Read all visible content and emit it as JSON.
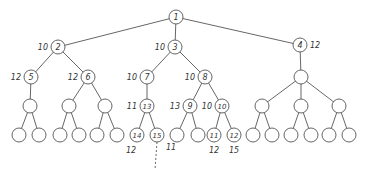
{
  "diagram": {
    "type": "tree",
    "stroke_color": "#555555",
    "node_radius": 7,
    "nodes": [
      {
        "id": "n1",
        "x": 176,
        "y": 17,
        "label": "1",
        "weight": "",
        "weight_side": "left"
      },
      {
        "id": "n2",
        "x": 58,
        "y": 47,
        "label": "2",
        "weight": "10",
        "weight_side": "left"
      },
      {
        "id": "n3",
        "x": 175,
        "y": 47,
        "label": "3",
        "weight": "10",
        "weight_side": "left"
      },
      {
        "id": "n4",
        "x": 300,
        "y": 45,
        "label": "4",
        "weight": "12",
        "weight_side": "right"
      },
      {
        "id": "n5",
        "x": 31,
        "y": 77,
        "label": "5",
        "weight": "12",
        "weight_side": "left"
      },
      {
        "id": "n6",
        "x": 88,
        "y": 77,
        "label": "6",
        "weight": "12",
        "weight_side": "left"
      },
      {
        "id": "n7",
        "x": 147,
        "y": 77,
        "label": "7",
        "weight": "10",
        "weight_side": "left"
      },
      {
        "id": "n8",
        "x": 205,
        "y": 77,
        "label": "8",
        "weight": "10",
        "weight_side": "left"
      },
      {
        "id": "n4a",
        "x": 301,
        "y": 77,
        "label": "",
        "weight": "",
        "weight_side": "left"
      },
      {
        "id": "n5a",
        "x": 30,
        "y": 106,
        "label": "",
        "weight": "",
        "weight_side": "left"
      },
      {
        "id": "n6a",
        "x": 69,
        "y": 106,
        "label": "",
        "weight": "",
        "weight_side": "left"
      },
      {
        "id": "n6b",
        "x": 105,
        "y": 106,
        "label": "",
        "weight": "",
        "weight_side": "left"
      },
      {
        "id": "n13",
        "x": 147,
        "y": 106,
        "label": "13",
        "weight": "11",
        "weight_side": "left"
      },
      {
        "id": "n9",
        "x": 190,
        "y": 106,
        "label": "9",
        "weight": "13",
        "weight_side": "left"
      },
      {
        "id": "n10",
        "x": 222,
        "y": 106,
        "label": "10",
        "weight": "10",
        "weight_side": "left"
      },
      {
        "id": "n4b",
        "x": 262,
        "y": 106,
        "label": "",
        "weight": "",
        "weight_side": "left"
      },
      {
        "id": "n4c",
        "x": 301,
        "y": 106,
        "label": "",
        "weight": "",
        "weight_side": "left"
      },
      {
        "id": "n4d",
        "x": 339,
        "y": 106,
        "label": "",
        "weight": "",
        "weight_side": "left"
      },
      {
        "id": "l1",
        "x": 19,
        "y": 135,
        "label": "",
        "weight": "",
        "weight_side": "below"
      },
      {
        "id": "l2",
        "x": 39,
        "y": 135,
        "label": "",
        "weight": "",
        "weight_side": "below"
      },
      {
        "id": "l3",
        "x": 60,
        "y": 135,
        "label": "",
        "weight": "",
        "weight_side": "below"
      },
      {
        "id": "l4",
        "x": 79,
        "y": 135,
        "label": "",
        "weight": "",
        "weight_side": "below"
      },
      {
        "id": "l5",
        "x": 97,
        "y": 135,
        "label": "",
        "weight": "",
        "weight_side": "below"
      },
      {
        "id": "l6",
        "x": 117,
        "y": 135,
        "label": "",
        "weight": "",
        "weight_side": "below"
      },
      {
        "id": "n14",
        "x": 137,
        "y": 135,
        "label": "14",
        "weight": "12",
        "weight_side": "below-left"
      },
      {
        "id": "n15",
        "x": 157,
        "y": 135,
        "label": "15",
        "weight": "11",
        "weight_side": "below-right"
      },
      {
        "id": "l9",
        "x": 177,
        "y": 135,
        "label": "",
        "weight": "",
        "weight_side": "below"
      },
      {
        "id": "l10",
        "x": 198,
        "y": 135,
        "label": "",
        "weight": "",
        "weight_side": "below"
      },
      {
        "id": "n11",
        "x": 214,
        "y": 135,
        "label": "11",
        "weight": "12",
        "weight_side": "below"
      },
      {
        "id": "n12",
        "x": 234,
        "y": 135,
        "label": "12",
        "weight": "15",
        "weight_side": "below"
      },
      {
        "id": "l13",
        "x": 253,
        "y": 135,
        "label": "",
        "weight": "",
        "weight_side": "below"
      },
      {
        "id": "l14",
        "x": 272,
        "y": 135,
        "label": "",
        "weight": "",
        "weight_side": "below"
      },
      {
        "id": "l15",
        "x": 291,
        "y": 135,
        "label": "",
        "weight": "",
        "weight_side": "below"
      },
      {
        "id": "l16",
        "x": 311,
        "y": 135,
        "label": "",
        "weight": "",
        "weight_side": "below"
      },
      {
        "id": "l17",
        "x": 329,
        "y": 135,
        "label": "",
        "weight": "",
        "weight_side": "below"
      },
      {
        "id": "l18",
        "x": 349,
        "y": 135,
        "label": "",
        "weight": "",
        "weight_side": "below"
      }
    ],
    "edges": [
      [
        "n1",
        "n2"
      ],
      [
        "n1",
        "n3"
      ],
      [
        "n1",
        "n4"
      ],
      [
        "n2",
        "n5"
      ],
      [
        "n2",
        "n6"
      ],
      [
        "n3",
        "n7"
      ],
      [
        "n3",
        "n8"
      ],
      [
        "n4",
        "n4a"
      ],
      [
        "n5",
        "n5a"
      ],
      [
        "n6",
        "n6a"
      ],
      [
        "n6",
        "n6b"
      ],
      [
        "n7",
        "n13"
      ],
      [
        "n8",
        "n9"
      ],
      [
        "n8",
        "n10"
      ],
      [
        "n4a",
        "n4b"
      ],
      [
        "n4a",
        "n4c"
      ],
      [
        "n4a",
        "n4d"
      ],
      [
        "n5a",
        "l1"
      ],
      [
        "n5a",
        "l2"
      ],
      [
        "n6a",
        "l3"
      ],
      [
        "n6a",
        "l4"
      ],
      [
        "n6b",
        "l5"
      ],
      [
        "n6b",
        "l6"
      ],
      [
        "n13",
        "n14"
      ],
      [
        "n13",
        "n15"
      ],
      [
        "n9",
        "l9"
      ],
      [
        "n9",
        "l10"
      ],
      [
        "n10",
        "n11"
      ],
      [
        "n10",
        "n12"
      ],
      [
        "n4b",
        "l13"
      ],
      [
        "n4b",
        "l14"
      ],
      [
        "n4c",
        "l15"
      ],
      [
        "n4c",
        "l16"
      ],
      [
        "n4d",
        "l17"
      ],
      [
        "n4d",
        "l18"
      ]
    ],
    "dashed_edges": [
      {
        "from": "n15",
        "x2": 155,
        "y2": 170
      }
    ]
  }
}
